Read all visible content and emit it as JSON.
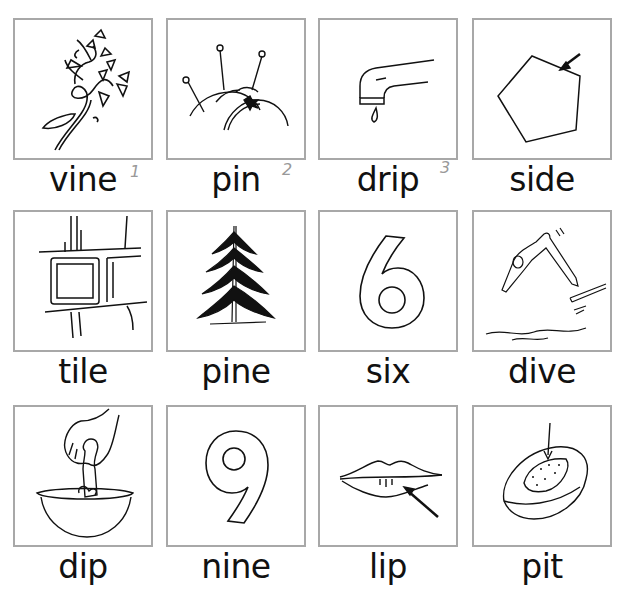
{
  "worksheet": {
    "cards": [
      {
        "word": "vine",
        "picture": "vine-icon"
      },
      {
        "word": "pin",
        "picture": "pincushion-icon"
      },
      {
        "word": "drip",
        "picture": "dripping-faucet-icon"
      },
      {
        "word": "side",
        "picture": "pentagon-side-arrow-icon"
      },
      {
        "word": "tile",
        "picture": "tile-wall-icon"
      },
      {
        "word": "pine",
        "picture": "pine-tree-icon"
      },
      {
        "word": "six",
        "picture": "number-six-icon"
      },
      {
        "word": "dive",
        "picture": "diver-icon"
      },
      {
        "word": "dip",
        "picture": "hand-dipping-bowl-icon"
      },
      {
        "word": "nine",
        "picture": "number-nine-icon"
      },
      {
        "word": "lip",
        "picture": "lips-arrow-icon"
      },
      {
        "word": "pit",
        "picture": "fruit-pit-icon"
      }
    ],
    "handwritten_marks": [
      "1",
      "2",
      "3"
    ],
    "colors": {
      "border": "#a8a8a8",
      "text": "#111111",
      "pencil": "#999999"
    }
  }
}
